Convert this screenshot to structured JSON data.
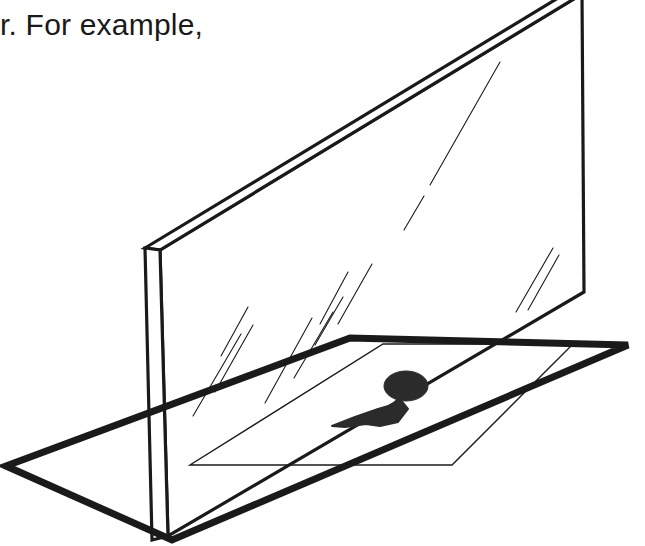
{
  "page": {
    "width": 645,
    "height": 546,
    "background_color": "#ffffff",
    "ink_color": "#1a1a1a"
  },
  "caption": {
    "text": "r. For example,"
  },
  "figure": {
    "name": "mirror-reflection-diagram",
    "stroke_color": "#1a1a1a",
    "fill_color": "#2b2b2b",
    "thick_stroke_width": 7,
    "medium_stroke_width": 3.2,
    "thin_stroke_width": 1.4,
    "hairline_stroke_width": 1.1,
    "parts": {
      "mirror_panel": {
        "label": "mirror-panel",
        "face_points": "160,250 582,-6 584,292 168,536",
        "front_edge_points": "145,248 160,250 168,536 152,540",
        "top_bevel_points": "145,248 568,-8 582,-6 160,250"
      },
      "ground_plane": {
        "label": "ground-plane",
        "points": "6,466 350,338 628,345 172,540"
      },
      "inner_parallelogram": {
        "label": "inner-region",
        "points": "383,344 573,344 452,465 190,465"
      },
      "object_shape": {
        "label": "object-silhouette",
        "head_cx": 406,
        "head_cy": 386,
        "head_rx": 22,
        "head_ry": 15,
        "tail_points": "399,398 392,405 378,409 355,417 332,426 345,427 366,424 380,426 398,422 408,409"
      },
      "sparkles": [
        {
          "x1": 193,
          "y1": 416,
          "x2": 241,
          "y2": 334
        },
        {
          "x1": 215,
          "y1": 392,
          "x2": 253,
          "y2": 325
        },
        {
          "x1": 221,
          "y1": 356,
          "x2": 248,
          "y2": 307
        },
        {
          "x1": 265,
          "y1": 403,
          "x2": 312,
          "y2": 318
        },
        {
          "x1": 294,
          "y1": 378,
          "x2": 333,
          "y2": 312
        },
        {
          "x1": 315,
          "y1": 345,
          "x2": 343,
          "y2": 297
        },
        {
          "x1": 320,
          "y1": 324,
          "x2": 348,
          "y2": 272
        },
        {
          "x1": 338,
          "y1": 324,
          "x2": 372,
          "y2": 264
        },
        {
          "x1": 430,
          "y1": 185,
          "x2": 500,
          "y2": 62
        },
        {
          "x1": 404,
          "y1": 230,
          "x2": 424,
          "y2": 196
        },
        {
          "x1": 516,
          "y1": 312,
          "x2": 553,
          "y2": 248
        },
        {
          "x1": 528,
          "y1": 310,
          "x2": 559,
          "y2": 255
        }
      ]
    }
  }
}
